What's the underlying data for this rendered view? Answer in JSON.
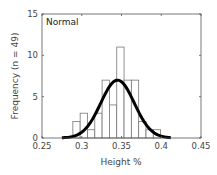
{
  "chart_data": {
    "type": "bar",
    "title": "",
    "annotation": "Normal",
    "xlabel": "Height %",
    "ylabel": "Frequency (n = 49)",
    "xlim": [
      0.25,
      0.45
    ],
    "ylim": [
      0,
      15
    ],
    "xticks": [
      "0.25",
      "0.3",
      "0.35",
      "0.4",
      "0.45"
    ],
    "yticks": [
      "0",
      "5",
      "10",
      "15"
    ],
    "grid": false,
    "histogram": {
      "bin_start": 0.2888,
      "bin_width": 0.0092,
      "counts": [
        2,
        3,
        1,
        3,
        7,
        4,
        11,
        7,
        7,
        2,
        1,
        1
      ]
    },
    "fit_curve": {
      "name": "Normal fit",
      "mean": 0.345,
      "peak": 7.0,
      "sigma": 0.021,
      "x_range": [
        0.275,
        0.412
      ]
    }
  }
}
